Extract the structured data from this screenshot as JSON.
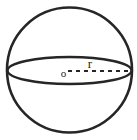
{
  "figure": {
    "kind": "geometry-diagram",
    "background_color": "#ffffff",
    "stroke_color": "#262626",
    "labels": {
      "center_point": "o",
      "radius": "r"
    },
    "geometry": {
      "sphere_outline": {
        "shape": "circle",
        "cx": 69.5,
        "cy": 70,
        "r": 62.5,
        "stroke_width": 2.6
      },
      "equator": {
        "shape": "ellipse",
        "cx": 69.5,
        "cy": 70.5,
        "rx": 62,
        "ry": 13.5,
        "stroke_width": 2.4
      },
      "radius_line": {
        "shape": "dashed-line",
        "x1": 68,
        "y1": 71,
        "x2": 131,
        "y2": 71,
        "stroke_width": 2.2,
        "dash_pattern": "4 4"
      },
      "center_label_position": {
        "x": 63.5,
        "y": 77
      },
      "radius_label_position": {
        "x": 90,
        "y": 68
      },
      "center_label_font_size": 11,
      "radius_label_font_size": 13
    }
  }
}
